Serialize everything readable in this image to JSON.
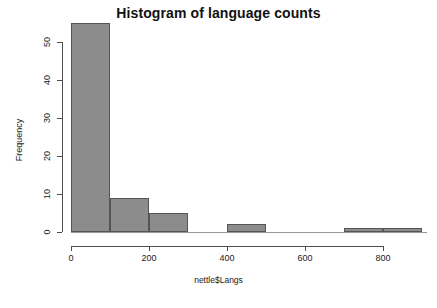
{
  "chart_data": {
    "type": "bar",
    "title": "Histogram of language counts",
    "xlabel": "nettle$Langs",
    "ylabel": "Frequency",
    "xlim": [
      0,
      900
    ],
    "ylim": [
      0,
      55
    ],
    "grid": false,
    "legend": null,
    "bin_width": 100,
    "bins": [
      {
        "x0": 0,
        "x1": 100,
        "value": 55
      },
      {
        "x0": 100,
        "x1": 200,
        "value": 9
      },
      {
        "x0": 200,
        "x1": 300,
        "value": 5
      },
      {
        "x0": 300,
        "x1": 400,
        "value": 0
      },
      {
        "x0": 400,
        "x1": 500,
        "value": 2
      },
      {
        "x0": 500,
        "x1": 600,
        "value": 0
      },
      {
        "x0": 600,
        "x1": 700,
        "value": 0
      },
      {
        "x0": 700,
        "x1": 800,
        "value": 1
      },
      {
        "x0": 800,
        "x1": 900,
        "value": 1
      }
    ],
    "categories": [
      "0-100",
      "100-200",
      "200-300",
      "300-400",
      "400-500",
      "500-600",
      "600-700",
      "700-800",
      "800-900"
    ],
    "values": [
      55,
      9,
      5,
      0,
      2,
      0,
      0,
      1,
      1
    ],
    "x_ticks": [
      {
        "value": 0,
        "label": "0"
      },
      {
        "value": 200,
        "label": "200"
      },
      {
        "value": 400,
        "label": "400"
      },
      {
        "value": 600,
        "label": "600"
      },
      {
        "value": 800,
        "label": "800"
      }
    ],
    "y_ticks": [
      {
        "value": 0,
        "label": "0"
      },
      {
        "value": 10,
        "label": "10"
      },
      {
        "value": 20,
        "label": "20"
      },
      {
        "value": 30,
        "label": "30"
      },
      {
        "value": 40,
        "label": "40"
      },
      {
        "value": 50,
        "label": "50"
      }
    ],
    "colors": {
      "bar_fill": "#8c8c8c",
      "bar_border": "#555555",
      "axis": "#4d4d4d",
      "text": "#1a1a1a",
      "background": "#ffffff"
    }
  }
}
